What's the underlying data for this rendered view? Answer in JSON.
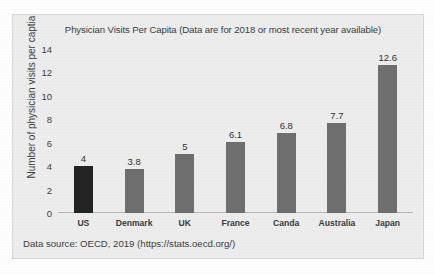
{
  "chart_data": {
    "type": "bar",
    "title": "Physician Visits Per Capita (Data are for 2018 or most recent year available)",
    "xlabel": "",
    "ylabel": "Number of physician visits per captia",
    "categories": [
      "US",
      "Denmark",
      "UK",
      "France",
      "Canda",
      "Australia",
      "Japan"
    ],
    "values": [
      4,
      3.8,
      5,
      6.1,
      6.8,
      7.7,
      12.6
    ],
    "value_labels": [
      "4",
      "3.8",
      "5",
      "6.1",
      "6.8",
      "7.7",
      "12.6"
    ],
    "ylim": [
      0,
      14
    ],
    "yticks": [
      14,
      12,
      10,
      8,
      6,
      4,
      2,
      0
    ],
    "ytick_labels": [
      "14",
      "12",
      "10",
      "8",
      "6",
      "4",
      "2",
      "0"
    ],
    "grid": false,
    "legend": "none",
    "bar_colors": [
      "#232323",
      "#6e6e6e",
      "#6e6e6e",
      "#6e6e6e",
      "#6e6e6e",
      "#6e6e6e",
      "#6e6e6e"
    ],
    "highlight_category": "US",
    "source_note": "Data source: OECD, 2019 (https://stats.oecd.org/)"
  },
  "colors": {
    "chart_background": "#ececec",
    "page_background": "#fdfdfd",
    "axis": "#b4b4b4",
    "text": "#3c3c3c",
    "highlight_bar": "#232323",
    "default_bar": "#6e6e6e"
  }
}
